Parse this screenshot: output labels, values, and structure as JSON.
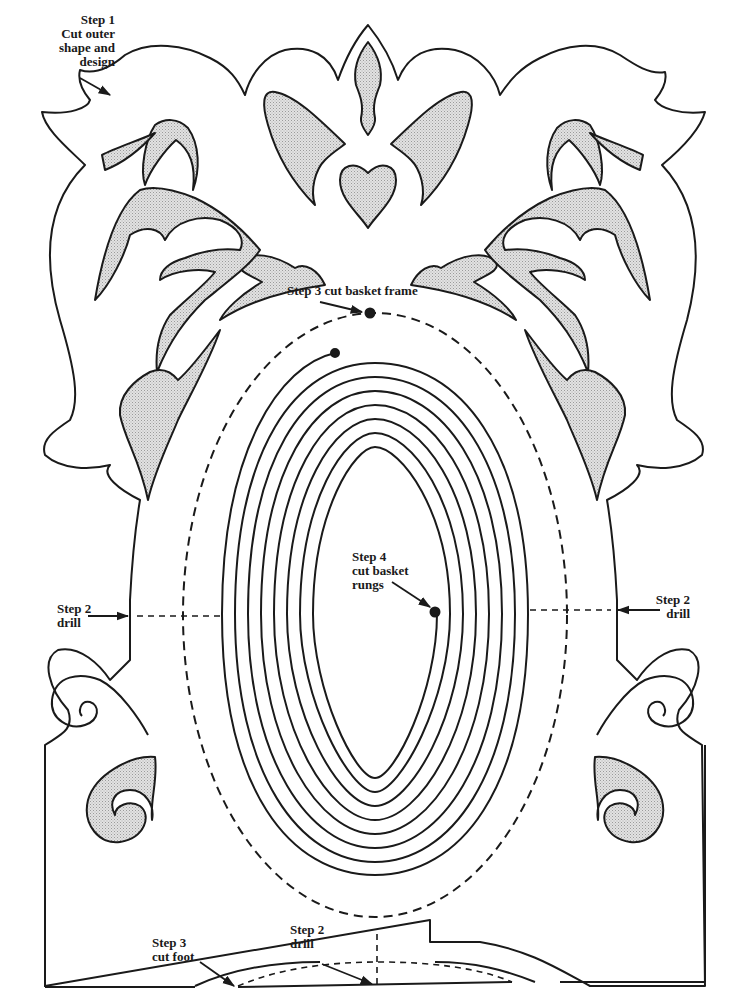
{
  "diagram": {
    "type": "scroll-saw pattern",
    "colors": {
      "line": "#1a1a1a",
      "waste_fill": "#d9d9d9",
      "background": "#ffffff"
    }
  },
  "labels": {
    "step1": {
      "line1": "Step 1",
      "line2": "Cut outer",
      "line3": "shape and",
      "line4": "design"
    },
    "step3_frame": {
      "text": "Step 3 cut basket frame"
    },
    "step4": {
      "line1": "Step 4",
      "line2": "cut basket",
      "line3": "rungs"
    },
    "step2_left": {
      "line1": "Step 2",
      "line2": "drill"
    },
    "step2_right": {
      "line1": "Step 2",
      "line2": "drill"
    },
    "step3_foot": {
      "line1": "Step 3",
      "line2": "cut foot"
    },
    "step2_bottom": {
      "line1": "Step 2",
      "line2": "drill"
    }
  }
}
